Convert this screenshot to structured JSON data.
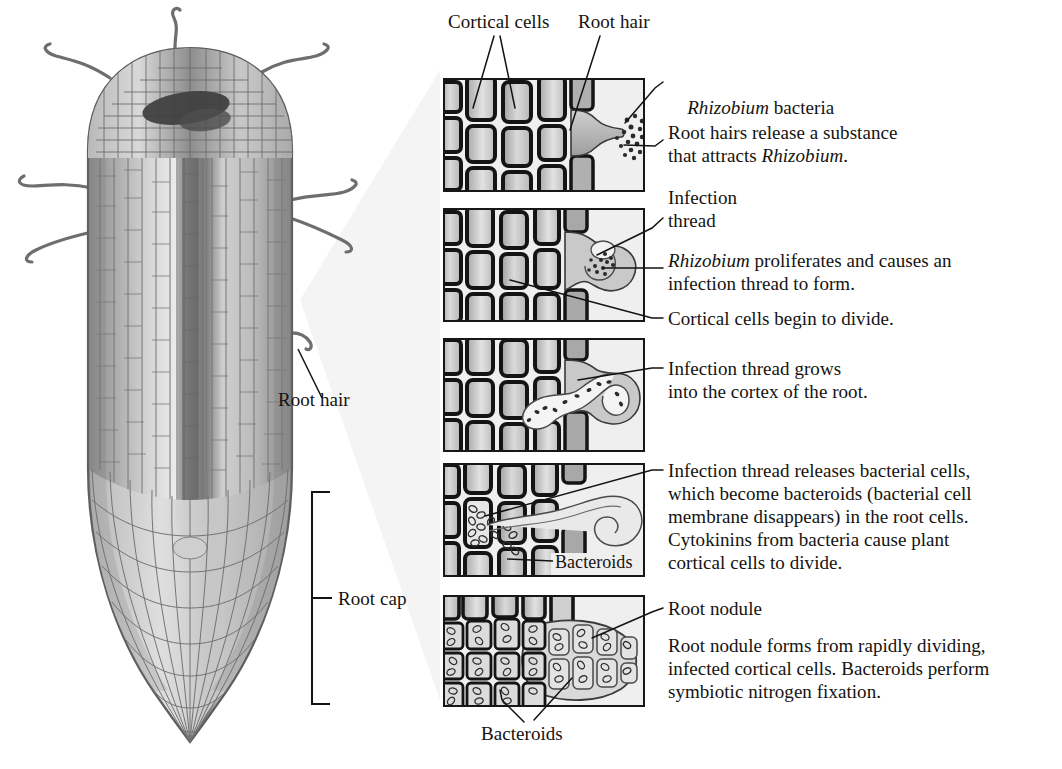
{
  "figure": {
    "title_hidden": "",
    "root_diagram": {
      "labels": [
        {
          "id": "root-hair",
          "text": "Root hair"
        },
        {
          "id": "root-cap",
          "text": "Root cap"
        }
      ]
    },
    "panel_column": {
      "top_labels": [
        {
          "id": "cortical-cells",
          "text": "Cortical cells"
        },
        {
          "id": "root-hair",
          "text": "Root hair"
        }
      ],
      "bottom_label": {
        "id": "bacteroids",
        "text": "Bacteroids"
      }
    },
    "steps": [
      {
        "index": 1,
        "callouts": [
          {
            "id": "rhizobium-bacteria",
            "text": "Rhizobium bacteria",
            "italic_prefix": "Rhizobium",
            "rest": " bacteria"
          }
        ],
        "caption_lines": [
          "Root hairs release a substance",
          "that attracts Rhizobium."
        ],
        "caption_italic_words": [
          "Rhizobium"
        ]
      },
      {
        "index": 2,
        "callouts": [
          {
            "id": "infection-thread",
            "lines": [
              "Infection",
              "thread"
            ]
          }
        ],
        "caption_lines": [
          "Rhizobium proliferates and causes an",
          "infection thread to form."
        ],
        "caption_italic_words": [
          "Rhizobium"
        ],
        "extra_callout": {
          "id": "cortical-cells-divide",
          "text": "Cortical cells begin to divide."
        }
      },
      {
        "index": 3,
        "caption_lines": [
          "Infection thread grows",
          "into the cortex of the root."
        ]
      },
      {
        "index": 4,
        "caption_lines": [
          "Infection thread releases bacterial cells,",
          "which become bacteroids (bacterial cell",
          "membrane disappears) in the root cells.",
          "Cytokinins from bacteria cause plant",
          "cortical cells to divide."
        ],
        "inner_label": {
          "id": "bacteroids",
          "text": "Bacteroids"
        }
      },
      {
        "index": 5,
        "callouts": [
          {
            "id": "root-nodule",
            "text": "Root nodule"
          }
        ],
        "caption_lines": [
          "Root nodule forms from rapidly dividing,",
          "infected cortical cells. Bacteroids perform",
          "symbiotic nitrogen fixation."
        ]
      }
    ],
    "colors": {
      "ink": "#15130f",
      "panel_border": "#171717",
      "panel_bg": "#eeeeee",
      "cell_fill_light": "#d8d8d8",
      "cell_fill_mid": "#bdbdbd",
      "cell_fill_dark": "#9a9a9a",
      "cell_wall": "#1c1c1c",
      "root_outline": "#5a5a5a",
      "root_tissue_light": "#e4e4e4",
      "root_tissue_mid": "#c2c2c2",
      "root_tissue_dark": "#8f8f8f",
      "root_core_dark": "#6d6d6d",
      "magnify_wedge": "#f2f2f2"
    }
  }
}
